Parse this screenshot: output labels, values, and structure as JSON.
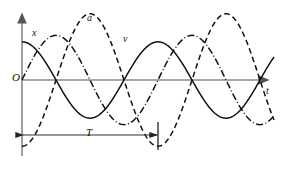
{
  "figure": {
    "background_color": "#ffffff",
    "ink_color": "#111111",
    "axis_color": "#808080",
    "width": 284,
    "height": 169
  },
  "labels": {
    "origin": "O",
    "time_axis": "t",
    "displacement_curve": "x",
    "acceleration_curve": "a",
    "velocity_curve": "v",
    "period": "T"
  },
  "axes": {
    "origin_px": {
      "x": 22,
      "y": 80
    },
    "x_axis_end_px": {
      "x": 272,
      "y": 80
    },
    "y_axis_top_px": {
      "x": 22,
      "y": 10
    },
    "y_axis_bottom_px": {
      "x": 22,
      "y": 156
    },
    "arrowheads": [
      "x-axis-right",
      "y-axis-up"
    ]
  },
  "period_marker": {
    "label": "T",
    "start_px": 22,
    "end_px": 158,
    "y_px": 135,
    "length_px": 136,
    "tick_top_px": 122,
    "tick_bottom_px": 150
  },
  "chart_data": {
    "type": "line",
    "title": "",
    "xlabel": "t",
    "ylabel": "",
    "grid": false,
    "legend": "inline-curve-labels",
    "xlim": [
      0,
      1.84
    ],
    "ylim": [
      -1.0,
      1.0
    ],
    "x_unit": "periods (T)",
    "period_T": 1.0,
    "series": [
      {
        "name": "x",
        "label": "x",
        "style": "solid",
        "amplitude": 0.53,
        "phase_deg": 90,
        "description": "displacement; starts at positive maximum at t = 0",
        "label_at": {
          "x": 0.07,
          "y": 0.52
        }
      },
      {
        "name": "v",
        "label": "v",
        "style": "dash-dot",
        "amplitude": 0.62,
        "phase_deg": 0,
        "description": "velocity; starts at zero at t = 0 moving negative, leads x by a quarter period",
        "label_at": {
          "x": 0.76,
          "y": 0.58
        }
      },
      {
        "name": "a",
        "label": "a",
        "style": "dashed",
        "amplitude": 0.92,
        "phase_deg": 270,
        "description": "acceleration; starts at negative maximum at t = 0, opposite in phase to x",
        "label_at": {
          "x": 0.5,
          "y": 0.9
        }
      }
    ]
  }
}
